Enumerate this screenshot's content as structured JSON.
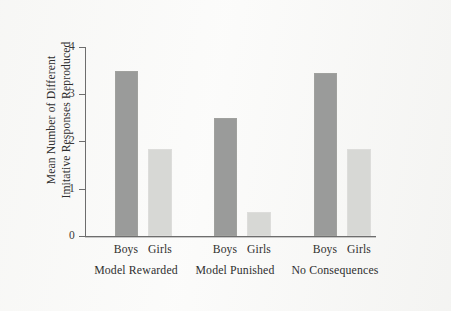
{
  "chart_data": {
    "type": "bar",
    "title": "",
    "xlabel": "",
    "ylabel_line1": "Mean Number of Different",
    "ylabel_line2": "Imitative Responses Reproduced",
    "ylim": [
      0,
      4
    ],
    "yticks": [
      "0",
      "1",
      "2",
      "3",
      "4"
    ],
    "ytick_values": [
      0,
      1,
      2,
      3,
      4
    ],
    "grid": false,
    "legend": "none",
    "categories": [
      "Model Rewarded",
      "Model Punished",
      "No Consequences"
    ],
    "subcategories": [
      "Boys",
      "Girls"
    ],
    "series": [
      {
        "name": "Boys",
        "color": "#9a9b9a",
        "values": [
          3.5,
          2.5,
          3.45
        ]
      },
      {
        "name": "Girls",
        "color": "#d7d8d5",
        "values": [
          1.85,
          0.5,
          1.85
        ]
      }
    ],
    "bars": [
      {
        "group": "Model Rewarded",
        "sub": "Boys",
        "value": 3.5
      },
      {
        "group": "Model Rewarded",
        "sub": "Girls",
        "value": 1.85
      },
      {
        "group": "Model Punished",
        "sub": "Boys",
        "value": 2.5
      },
      {
        "group": "Model Punished",
        "sub": "Girls",
        "value": 0.5
      },
      {
        "group": "No Consequences",
        "sub": "Boys",
        "value": 3.45
      },
      {
        "group": "No Consequences",
        "sub": "Girls",
        "value": 1.85
      }
    ],
    "colors": {
      "boys": "#9a9b9a",
      "girls": "#d7d8d5",
      "axis": "#6d6d6d",
      "background": "#fbfbfa",
      "text": "#2f2f2f"
    }
  }
}
